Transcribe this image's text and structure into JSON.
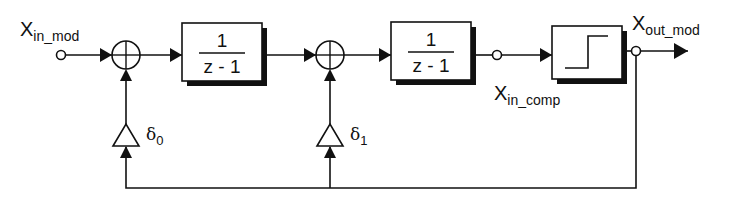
{
  "diagram": {
    "title": "",
    "colors": {
      "stroke": "#111111",
      "background": "#ffffff",
      "shadow": "#111111"
    },
    "input": {
      "label_main": "X",
      "label_sub": "in_mod"
    },
    "comparator_input": {
      "label_main": "X",
      "label_sub": "in_comp"
    },
    "output": {
      "label_main": "X",
      "label_sub": "out_mod"
    },
    "integrator_1": {
      "numerator": "1",
      "denominator": "z - 1"
    },
    "integrator_2": {
      "numerator": "1",
      "denominator": "z - 1"
    },
    "comparator": {
      "icon": "step-function-icon"
    },
    "gain_0": {
      "symbol": "δ",
      "subscript": "0"
    },
    "gain_1": {
      "symbol": "δ",
      "subscript": "1"
    },
    "sum_junction_1": {
      "icon": "summing-junction-icon"
    },
    "sum_junction_2": {
      "icon": "summing-junction-icon"
    }
  }
}
